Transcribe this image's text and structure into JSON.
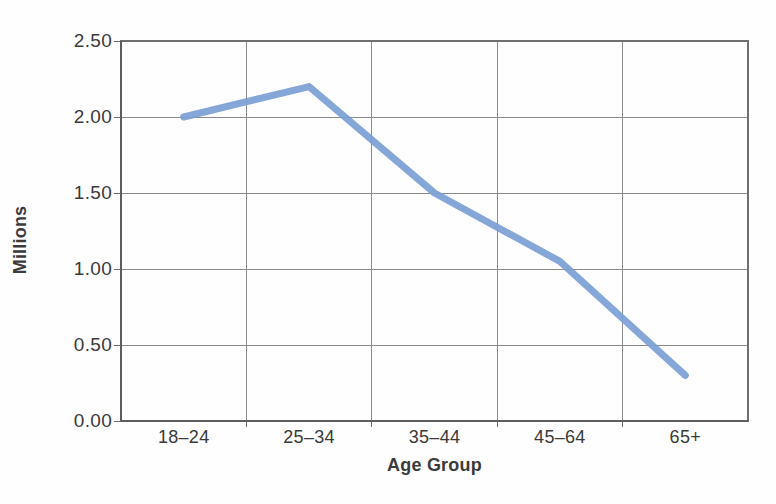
{
  "chart_data": {
    "type": "line",
    "title": "",
    "xlabel": "Age Group",
    "ylabel": "Millions",
    "categories": [
      "18–24",
      "25–34",
      "35–44",
      "45–64",
      "65+"
    ],
    "values": [
      2.0,
      2.2,
      1.5,
      1.05,
      0.3
    ],
    "series": [
      {
        "name": "",
        "values": [
          2.0,
          2.2,
          1.5,
          1.05,
          0.3
        ]
      }
    ],
    "ylim": [
      0.0,
      2.5
    ],
    "ytick_values": [
      0.0,
      0.5,
      1.0,
      1.5,
      2.0,
      2.5
    ],
    "ytick_labels": [
      "0.00",
      "0.50",
      "1.00",
      "1.50",
      "2.00",
      "2.50"
    ],
    "grid": "both",
    "legend": "none",
    "markers": "none",
    "line_color": "#7b9fd4",
    "line_width": 7,
    "axis_color": "#6f6f6f",
    "grid_color": "#8a8a8a",
    "text_color": "#3a3a3a",
    "background": "#ffffff"
  },
  "axes": {
    "y_title": "Millions",
    "x_title": "Age Group",
    "y_ticks": [
      "2.50",
      "2.00",
      "1.50",
      "1.00",
      "0.50",
      "0.00"
    ],
    "x_ticks": [
      "18–24",
      "25–34",
      "35–44",
      "45–64",
      "65+"
    ]
  }
}
